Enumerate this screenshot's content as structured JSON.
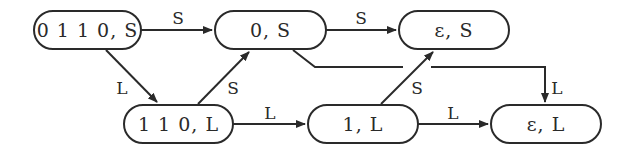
{
  "diagram": {
    "nodes": [
      {
        "id": "n0110S",
        "label": "0 1 1 0, S"
      },
      {
        "id": "n0S",
        "label": "0, S"
      },
      {
        "id": "neS",
        "label": "ε, S"
      },
      {
        "id": "n110L",
        "label": "1 1 0, L"
      },
      {
        "id": "n1L",
        "label": "1, L"
      },
      {
        "id": "neL",
        "label": "ε, L"
      }
    ],
    "edges": [
      {
        "from": "n0110S",
        "to": "n0S",
        "label": "S"
      },
      {
        "from": "n0S",
        "to": "neS",
        "label": "S"
      },
      {
        "from": "n0110S",
        "to": "n110L",
        "label": "L"
      },
      {
        "from": "n110L",
        "to": "n0S",
        "label": "S"
      },
      {
        "from": "n110L",
        "to": "n1L",
        "label": "L"
      },
      {
        "from": "n1L",
        "to": "neS",
        "label": "S"
      },
      {
        "from": "n1L",
        "to": "neL",
        "label": "L"
      },
      {
        "from": "n0S",
        "to": "neL",
        "label": "L"
      }
    ],
    "colors": {
      "stroke": "#2a2a2a",
      "background": "#ffffff"
    }
  }
}
